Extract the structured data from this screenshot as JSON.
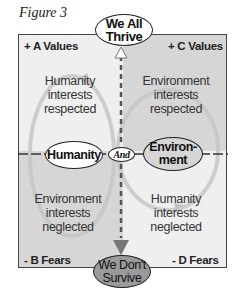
{
  "figure_label": "Figure 3",
  "top_outcome": {
    "line1": "We All",
    "line2": "Thrive"
  },
  "bottom_outcome": {
    "line1": "We Don't",
    "line2": "Survive"
  },
  "quadrants": {
    "top_left": {
      "corner": "+ A Values",
      "text": [
        "Humanity",
        "interests",
        "respected"
      ]
    },
    "top_right": {
      "corner": "+ C Values",
      "text": [
        "Environment",
        "interests",
        "respected"
      ]
    },
    "bottom_left": {
      "corner": "- B Fears",
      "text": [
        "Environment",
        "interests",
        "neglected"
      ]
    },
    "bottom_right": {
      "corner": "- D Fears",
      "text": [
        "Humanity",
        "interests",
        "neglected"
      ]
    }
  },
  "center": {
    "left_pole": "Humanity",
    "connector": "And",
    "right_pole": {
      "line1": "Environ-",
      "line2": "ment"
    }
  },
  "colors": {
    "light_quadrant": "#efefef",
    "dark_quadrant": "#d6d6d6",
    "bottom_oval_fill": "#9a9a9a",
    "border": "#444444"
  }
}
